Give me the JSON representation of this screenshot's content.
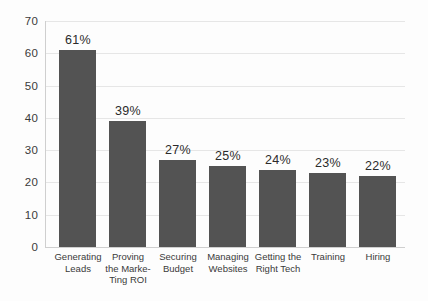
{
  "chart_data": {
    "type": "bar",
    "title": "",
    "subtitle": "",
    "xlabel": "",
    "ylabel": "",
    "ylim": [
      0,
      70
    ],
    "ytick_step": 10,
    "yticks": [
      70,
      60,
      50,
      40,
      30,
      20,
      10,
      0
    ],
    "grid": true,
    "legend": false,
    "categories": [
      "Generating Leads",
      "Proving the Marke-Ting ROI",
      "Securing Budget",
      "Managing Websites",
      "Getting the Right Tech",
      "Training",
      "Hiring"
    ],
    "category_lines": [
      [
        "Generating",
        "Leads"
      ],
      [
        "Proving",
        "the Marke-",
        "Ting ROI"
      ],
      [
        "Securing",
        "Budget"
      ],
      [
        "Managing",
        "Websites"
      ],
      [
        "Getting the",
        "Right Tech"
      ],
      [
        "Training"
      ],
      [
        "Hiring"
      ]
    ],
    "values": [
      61,
      39,
      27,
      25,
      24,
      23,
      22
    ],
    "data_labels": [
      "61%",
      "39%",
      "27%",
      "25%",
      "24%",
      "23%",
      "22%"
    ],
    "colors": {
      "bar": "#535353",
      "background": "#fdfdfd",
      "gridline": "#e6e6e6",
      "axis": "#cfcfcf",
      "text": "#3a3a3a",
      "value_text": "#2b2b2b"
    }
  }
}
